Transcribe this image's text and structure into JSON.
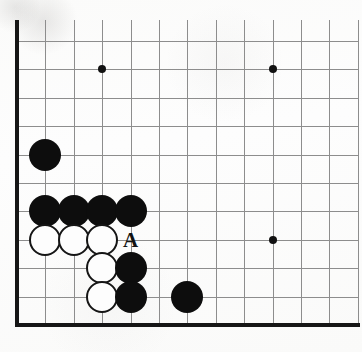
{
  "figure": {
    "kind": "go-board-diagram",
    "width": 362,
    "height": 352
  },
  "board": {
    "origin_x": 17,
    "origin_y": 41,
    "cell_size": 28.4,
    "columns_visible": 13,
    "rows_visible": 11,
    "line_color": "#8d8d8d",
    "edge_color": "#161616",
    "background_color": "#fdfdfc",
    "edges": [
      {
        "name": "left-edge",
        "side": "left"
      },
      {
        "name": "bottom-edge",
        "side": "bottom"
      }
    ],
    "star_points": [
      {
        "col": 4,
        "row": 2
      },
      {
        "col": 10,
        "row": 2
      },
      {
        "col": 10,
        "row": 8
      }
    ]
  },
  "stones": [
    {
      "color": "black",
      "col": 2,
      "row": 5
    },
    {
      "color": "black",
      "col": 2,
      "row": 7
    },
    {
      "color": "black",
      "col": 3,
      "row": 7
    },
    {
      "color": "black",
      "col": 4,
      "row": 7
    },
    {
      "color": "black",
      "col": 5,
      "row": 7
    },
    {
      "color": "white",
      "col": 2,
      "row": 8
    },
    {
      "color": "white",
      "col": 3,
      "row": 8
    },
    {
      "color": "white",
      "col": 4,
      "row": 8
    },
    {
      "color": "white",
      "col": 4,
      "row": 9
    },
    {
      "color": "white",
      "col": 4,
      "row": 10
    },
    {
      "color": "black",
      "col": 5,
      "row": 9
    },
    {
      "color": "black",
      "col": 5,
      "row": 10
    },
    {
      "color": "black",
      "col": 7,
      "row": 10
    }
  ],
  "labels": [
    {
      "text": "A",
      "col": 5,
      "row": 8
    }
  ]
}
